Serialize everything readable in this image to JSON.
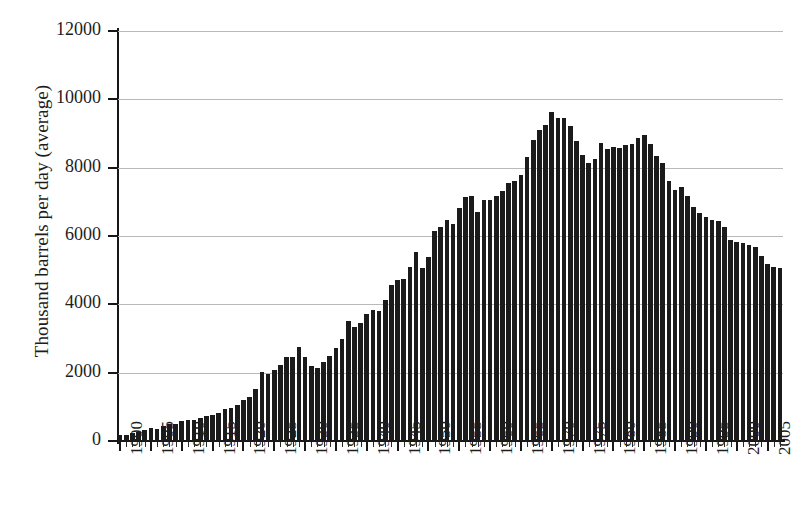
{
  "chart_data": {
    "type": "bar",
    "title": "",
    "subtitle": "",
    "xlabel": "",
    "ylabel": "Thousand barrels per day (average)",
    "ylim": [
      0,
      12000
    ],
    "xlim": [
      1900,
      2007
    ],
    "grid": true,
    "legend": null,
    "y_ticks": [
      0,
      2000,
      4000,
      6000,
      8000,
      10000,
      12000
    ],
    "y_tick_labels": [
      "0",
      "2000",
      "4000",
      "6000",
      "8000",
      "10000",
      "12000"
    ],
    "x_ticks": [
      1900,
      1905,
      1910,
      1915,
      1920,
      1925,
      1930,
      1935,
      1940,
      1945,
      1950,
      1955,
      1960,
      1965,
      1970,
      1975,
      1980,
      1985,
      1990,
      1995,
      2000,
      2005
    ],
    "x_tick_labels": [
      "1900",
      "1905",
      "1910",
      "1915",
      "1920",
      "1925",
      "1930",
      "1935",
      "1940",
      "1945",
      "1950",
      "1955",
      "1960",
      "1965",
      "1970",
      "1975",
      "1980",
      "1985",
      "1990",
      "1995",
      "2000",
      "2005"
    ],
    "bar_color": "#1b1b1b",
    "grid_color": "#b9b9b9",
    "axis_color": "#171717",
    "categories": [
      1900,
      1901,
      1902,
      1903,
      1904,
      1905,
      1906,
      1907,
      1908,
      1909,
      1910,
      1911,
      1912,
      1913,
      1914,
      1915,
      1916,
      1917,
      1918,
      1919,
      1920,
      1921,
      1922,
      1923,
      1924,
      1925,
      1926,
      1927,
      1928,
      1929,
      1930,
      1931,
      1932,
      1933,
      1934,
      1935,
      1936,
      1937,
      1938,
      1939,
      1940,
      1941,
      1942,
      1943,
      1944,
      1945,
      1946,
      1947,
      1948,
      1949,
      1950,
      1951,
      1952,
      1953,
      1954,
      1955,
      1956,
      1957,
      1958,
      1959,
      1960,
      1961,
      1962,
      1963,
      1964,
      1965,
      1966,
      1967,
      1968,
      1969,
      1970,
      1971,
      1972,
      1973,
      1974,
      1975,
      1976,
      1977,
      1978,
      1979,
      1980,
      1981,
      1982,
      1983,
      1984,
      1985,
      1986,
      1987,
      1988,
      1989,
      1990,
      1991,
      1992,
      1993,
      1994,
      1995,
      1996,
      1997,
      1998,
      1999,
      2000,
      2001,
      2002,
      2003,
      2004,
      2005,
      2006,
      2007
    ],
    "values": [
      175,
      190,
      240,
      270,
      320,
      370,
      350,
      440,
      485,
      505,
      575,
      610,
      625,
      680,
      730,
      770,
      830,
      930,
      975,
      1040,
      1210,
      1290,
      1530,
      2010,
      1950,
      2090,
      2230,
      2470,
      2460,
      2760,
      2460,
      2190,
      2150,
      2310,
      2480,
      2730,
      3000,
      3500,
      3330,
      3460,
      3710,
      3840,
      3800,
      4120,
      4580,
      4700,
      4750,
      5090,
      5520,
      5050,
      5400,
      6160,
      6260,
      6460,
      6340,
      6810,
      7150,
      7170,
      6710,
      7050,
      7040,
      7180,
      7330,
      7540,
      7610,
      7800,
      8300,
      8810,
      9100,
      9240,
      9640,
      9460,
      9440,
      9210,
      8770,
      8370,
      8130,
      8240,
      8710,
      8550,
      8600,
      8570,
      8650,
      8690,
      8880,
      8970,
      8680,
      8350,
      8140,
      7610,
      7360,
      7420,
      7170,
      6850,
      6660,
      6560,
      6470,
      6450,
      6250,
      5880,
      5820,
      5800,
      5750,
      5680,
      5420,
      5180,
      5100,
      5060
    ]
  },
  "figure": {
    "background": "#ffffff",
    "font": "serif"
  }
}
